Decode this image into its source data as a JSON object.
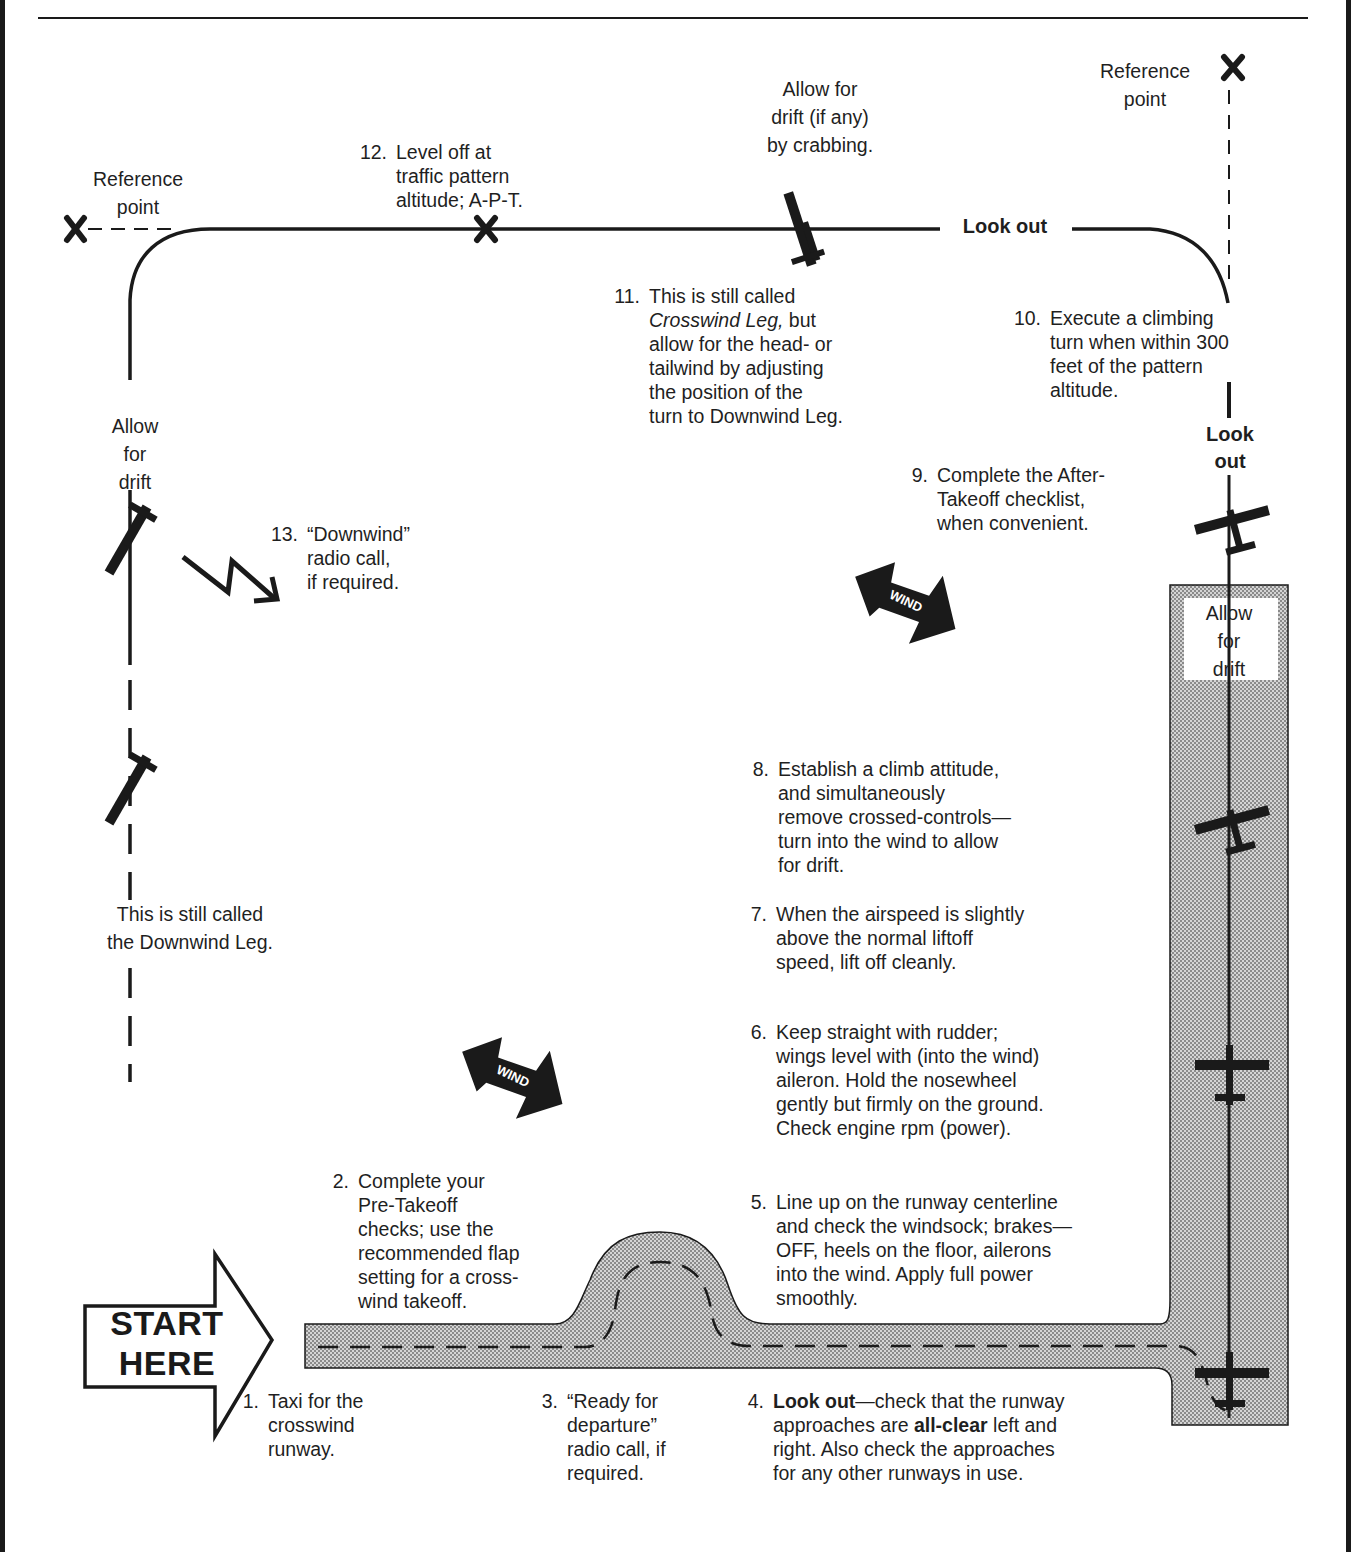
{
  "figure": {
    "type": "crosswind-takeoff-traffic-pattern",
    "start_label": [
      "START",
      "HERE"
    ],
    "wind_label": "WIND",
    "colors": {
      "ink": "#1a1a1a",
      "runway_fill": "#c8c8c8",
      "paper": "#ffffff"
    }
  },
  "labels": {
    "reference_point_left": "Reference\npoint",
    "reference_point_right": "Reference\npoint",
    "allow_drift_crabbing": "Allow for\ndrift (if any)\nby crabbing.",
    "allow_drift_downwind": "Allow\nfor\ndrift",
    "allow_drift_runway": "Allow\nfor\ndrift",
    "downwind_leg_note": "This is still called\nthe Downwind Leg.",
    "look_out_crosswind": "Look out",
    "look_out_climb": "Look\nout"
  },
  "steps": [
    {
      "num": "1.",
      "text": "Taxi for the\ncrosswind\nrunway."
    },
    {
      "num": "2.",
      "text": "Complete your\nPre-Takeoff\nchecks; use the\nrecommended flap\nsetting for a cross-\nwind takeoff."
    },
    {
      "num": "3.",
      "text": "“Ready for\ndeparture”\nradio call, if\nrequired."
    },
    {
      "num": "4.",
      "bold_lead": "Look out",
      "text_a": "—check that the runway\napproaches are ",
      "bold_mid": "all-clear",
      "text_b": " left and\nright. Also check the approaches\nfor any other runways in use."
    },
    {
      "num": "5.",
      "text": "Line up on the runway centerline\nand check the windsock; brakes—\nOFF, heels on the floor, ailerons\ninto the wind. Apply full power\nsmoothly."
    },
    {
      "num": "6.",
      "text": "Keep straight with rudder;\nwings level with (into the wind)\naileron. Hold the nosewheel\ngently but firmly on the ground.\nCheck engine rpm (power)."
    },
    {
      "num": "7.",
      "text": "When the airspeed is slightly\nabove the normal liftoff\nspeed, lift off cleanly."
    },
    {
      "num": "8.",
      "text": "Establish a climb attitude,\nand simultaneously\nremove crossed-controls—\nturn into the wind to allow\nfor drift."
    },
    {
      "num": "9.",
      "text": "Complete the After-\nTakeoff checklist,\nwhen convenient."
    },
    {
      "num": "10.",
      "text": "Execute a climbing\nturn when within 300\nfeet of the pattern\naltitude."
    },
    {
      "num": "11.",
      "italic_lead": "Crosswind Leg,",
      "text_pre": "This is still called\n",
      "text": " but\nallow for the head- or\ntailwind by adjusting\nthe position of the\nturn to Downwind Leg."
    },
    {
      "num": "12.",
      "text": "Level off at\ntraffic pattern\naltitude; A-P-T."
    },
    {
      "num": "13.",
      "text": "“Downwind”\nradio call,\nif required."
    }
  ]
}
